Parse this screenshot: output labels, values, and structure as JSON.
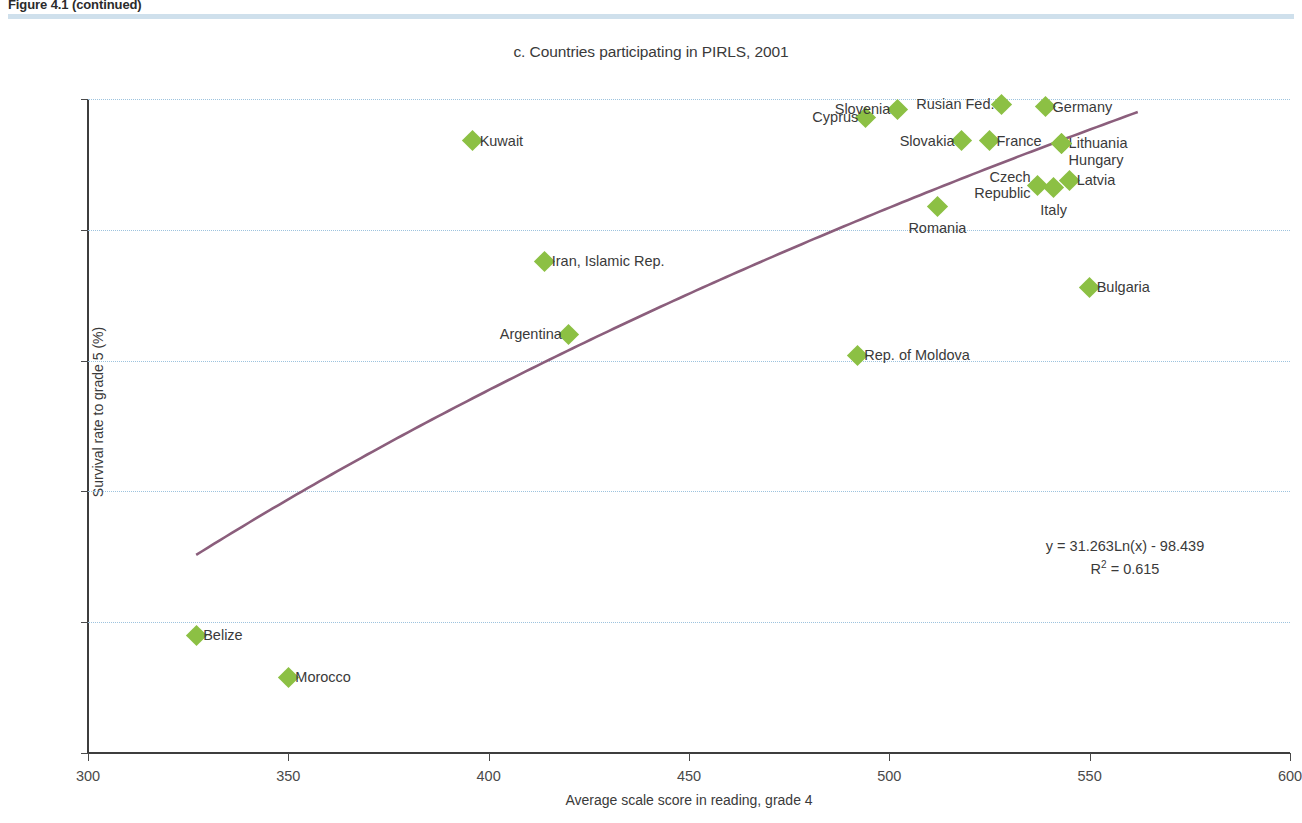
{
  "figure_caption": "Figure 4.1 (continued)",
  "chart_data": {
    "type": "scatter",
    "title": "c. Countries participating in PIRLS, 2001",
    "xlabel": "Average scale score in reading, grade 4",
    "ylabel": "Survival rate to grade 5 (%)",
    "xlim": [
      300,
      600
    ],
    "ylim": [
      75,
      100
    ],
    "xticks": [
      300,
      350,
      400,
      450,
      500,
      550,
      600
    ],
    "yticks": [
      75,
      80,
      85,
      90,
      95,
      100
    ],
    "grid": "horizontal-dotted",
    "legend": "none",
    "marker_color": "#8cc044",
    "trendline_color": "#8b5e7c",
    "gridline_color": "#9dc3de",
    "annotations": {
      "equation": "y = 31.263Ln(x) - 98.439",
      "r_squared_prefix": "R",
      "r_squared_exp": "2",
      "r_squared_value": " = 0.615"
    },
    "trendline": {
      "type": "logarithmic",
      "slope": 31.263,
      "intercept": -98.439,
      "r_squared": 0.615,
      "x_start": 327,
      "x_end": 562
    },
    "points": [
      {
        "name": "Belize",
        "x": 327,
        "y": 79.5,
        "label_pos": "right"
      },
      {
        "name": "Morocco",
        "x": 350,
        "y": 77.9,
        "label_pos": "right"
      },
      {
        "name": "Kuwait",
        "x": 396,
        "y": 98.4,
        "label_pos": "right"
      },
      {
        "name": "Iran, Islamic Rep.",
        "x": 414,
        "y": 93.8,
        "label_pos": "right"
      },
      {
        "name": "Argentina",
        "x": 420,
        "y": 91.0,
        "label_pos": "left"
      },
      {
        "name": "Rep. of Moldova",
        "x": 492,
        "y": 90.2,
        "label_pos": "right"
      },
      {
        "name": "Cyprus",
        "x": 494,
        "y": 99.3,
        "label_pos": "left"
      },
      {
        "name": "Slovenia",
        "x": 502,
        "y": 99.6,
        "label_pos": "left"
      },
      {
        "name": "Romania",
        "x": 512,
        "y": 95.9,
        "label_pos": "below"
      },
      {
        "name": "Slovakia",
        "x": 518,
        "y": 98.4,
        "label_pos": "left"
      },
      {
        "name": "France",
        "x": 525,
        "y": 98.4,
        "label_pos": "right"
      },
      {
        "name": "Rusian Fed.",
        "x": 528,
        "y": 99.8,
        "label_pos": "left"
      },
      {
        "name": "Czech Republic",
        "x": 537,
        "y": 96.7,
        "label_pos": "left2"
      },
      {
        "name": "Germany",
        "x": 539,
        "y": 99.7,
        "label_pos": "right"
      },
      {
        "name": "Italy",
        "x": 541,
        "y": 96.6,
        "label_pos": "below"
      },
      {
        "name": "Lithuania",
        "x": 543,
        "y": 98.3,
        "label_pos": "right"
      },
      {
        "name": "Hungary",
        "x": 543,
        "y": 98.3,
        "label_pos": "right2"
      },
      {
        "name": "Latvia",
        "x": 545,
        "y": 96.9,
        "label_pos": "right"
      },
      {
        "name": "Bulgaria",
        "x": 550,
        "y": 92.8,
        "label_pos": "right"
      }
    ]
  }
}
